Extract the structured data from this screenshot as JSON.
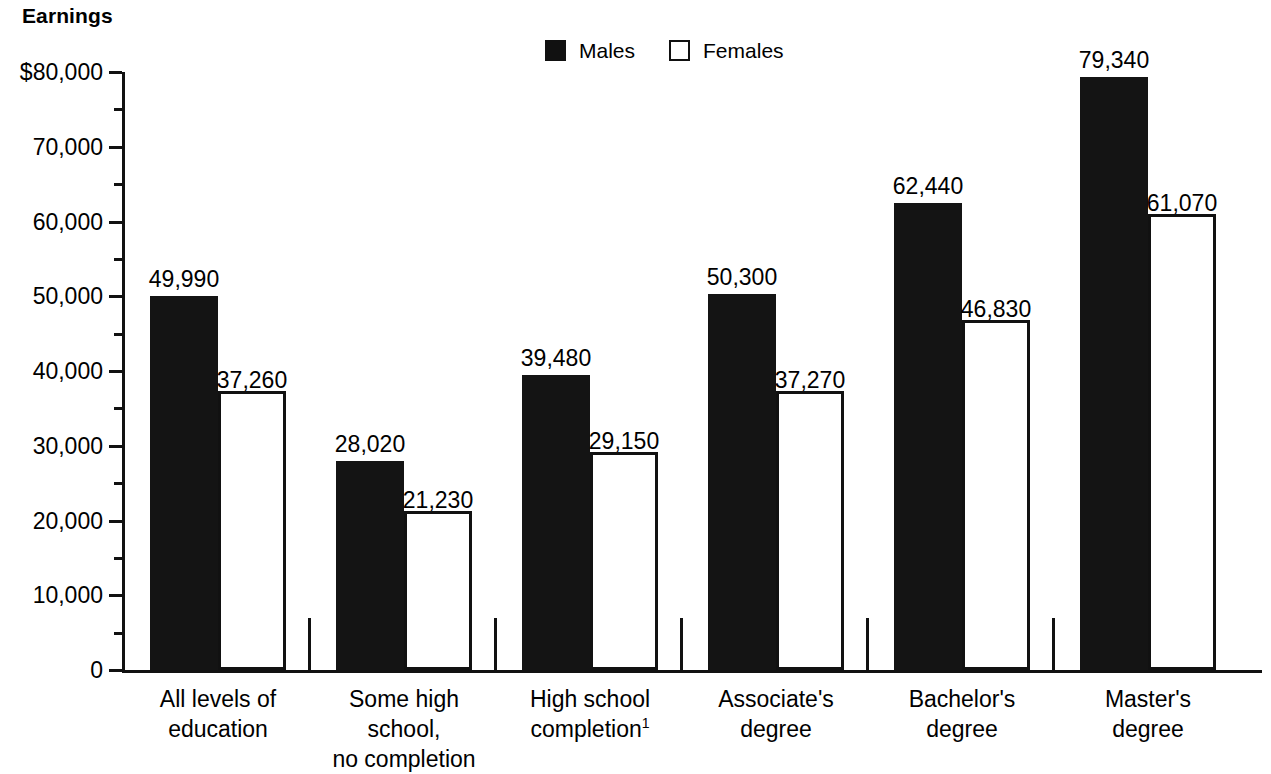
{
  "axis_title": "Earnings",
  "legend": {
    "position": "top-center",
    "items": [
      {
        "label": "Males",
        "style": "filled",
        "color": "#141414"
      },
      {
        "label": "Females",
        "style": "hollow",
        "color": "#ffffff"
      }
    ]
  },
  "y_axis": {
    "ticks": [
      "$80,000",
      "70,000",
      "60,000",
      "50,000",
      "40,000",
      "30,000",
      "20,000",
      "10,000",
      "0"
    ],
    "tick_values": [
      80000,
      70000,
      60000,
      50000,
      40000,
      30000,
      20000,
      10000,
      0
    ],
    "minor_tick_values": [
      75000,
      65000,
      55000,
      45000,
      35000,
      25000,
      15000,
      5000
    ],
    "min": 0,
    "max": 80000
  },
  "footnote_marker": "1",
  "chart_data": {
    "type": "bar",
    "title": "Earnings",
    "xlabel": "",
    "ylabel": "Earnings",
    "ylim": [
      0,
      80000
    ],
    "grid": false,
    "legend_position": "top-center",
    "categories": [
      "All levels of\neducation",
      "Some high school,\nno completion",
      "High school\ncompletion",
      "Associate's\ndegree",
      "Bachelor's\ndegree",
      "Master's\ndegree"
    ],
    "series": [
      {
        "name": "Males",
        "values": [
          49990,
          28020,
          39480,
          50300,
          62440,
          79340
        ],
        "labels": [
          "49,990",
          "28,020",
          "39,480",
          "50,300",
          "62,440",
          "79,340"
        ]
      },
      {
        "name": "Females",
        "values": [
          37260,
          21230,
          29150,
          37270,
          46830,
          61070
        ],
        "labels": [
          "37,260",
          "21,230",
          "29,150",
          "37,270",
          "46,830",
          "61,070"
        ]
      }
    ]
  }
}
